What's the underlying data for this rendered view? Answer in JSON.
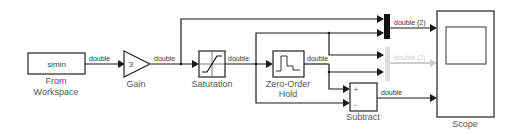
{
  "blocks": {
    "from_workspace": {
      "param": "simin",
      "label_line1": "From",
      "label_line2": "Workspace"
    },
    "gain": {
      "value": "3",
      "label": "Gain"
    },
    "saturation": {
      "label": "Saturation"
    },
    "zoh": {
      "label_line1": "Zero-Order",
      "label_line2": "Hold"
    },
    "subtract": {
      "plus": "+",
      "minus": "-",
      "label": "Subtract"
    },
    "mux1": {
      "label": ""
    },
    "mux2": {
      "label": ""
    },
    "scope": {
      "label": "Scope"
    }
  },
  "signals": {
    "fw_to_gain": "double",
    "gain_out": "double",
    "sat_out": "double",
    "zoh_out": "double",
    "mux1_out": "double (2)",
    "mux2_out": "double (2)",
    "sub_out": "double"
  }
}
